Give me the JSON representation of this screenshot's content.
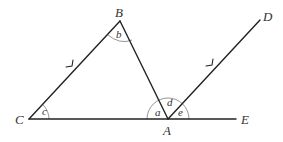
{
  "diagram": {
    "type": "geometry",
    "points": {
      "A": {
        "label": "A",
        "x": 168,
        "y": 119
      },
      "B": {
        "label": "B",
        "x": 120,
        "y": 21
      },
      "C": {
        "label": "C",
        "x": 29,
        "y": 119
      },
      "D": {
        "label": "D",
        "x": 260,
        "y": 20
      },
      "E": {
        "label": "E",
        "x": 236,
        "y": 119
      }
    },
    "segments": [
      {
        "from": "C",
        "to": "B",
        "parallel_mark": true
      },
      {
        "from": "B",
        "to": "A",
        "parallel_mark": false
      },
      {
        "from": "C",
        "to": "E",
        "parallel_mark": false
      },
      {
        "from": "A",
        "to": "D",
        "parallel_mark": true
      }
    ],
    "angles": {
      "a": {
        "label": "a",
        "vertex": "A",
        "between": [
          "B",
          "C"
        ]
      },
      "b": {
        "label": "b",
        "vertex": "B",
        "between": [
          "C",
          "A"
        ]
      },
      "c": {
        "label": "c",
        "vertex": "C",
        "between": [
          "B",
          "A"
        ]
      },
      "d": {
        "label": "d",
        "vertex": "A",
        "between": [
          "B",
          "D"
        ]
      },
      "e": {
        "label": "e",
        "vertex": "A",
        "between": [
          "D",
          "E"
        ]
      }
    },
    "colors": {
      "line": "#222222",
      "arc": "#888888",
      "label": "#333333"
    }
  }
}
